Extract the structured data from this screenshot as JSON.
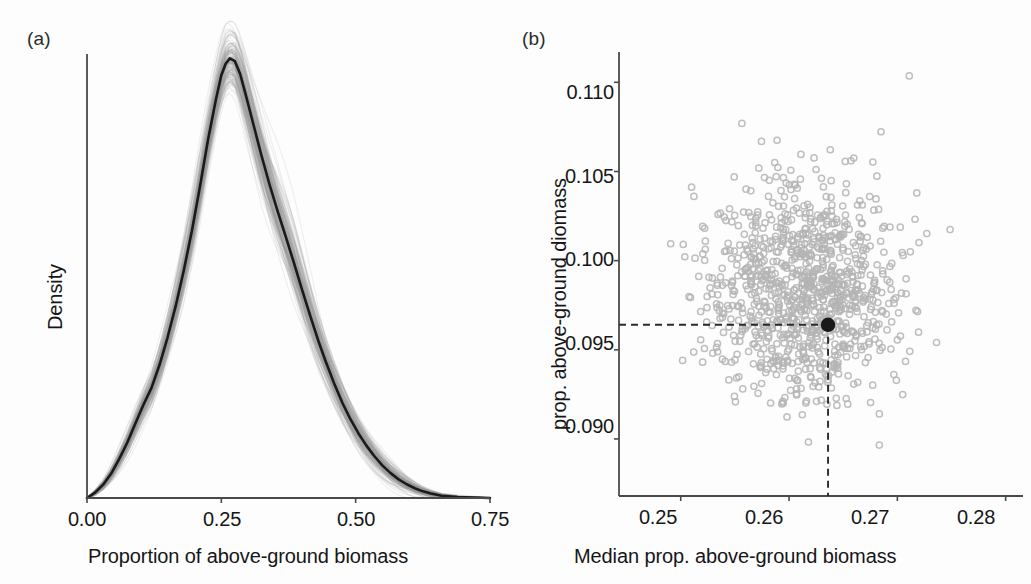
{
  "figure": {
    "background": "#fdfdfd",
    "panels": [
      "a",
      "b"
    ]
  },
  "panel_a": {
    "tag": "(a)",
    "xlabel": "Proportion of above-ground biomass",
    "ylabel": "Density",
    "xticks": [
      "0.00",
      "0.25",
      "0.50",
      "0.75"
    ]
  },
  "panel_b": {
    "tag": "(b)",
    "xlabel": "Median prop. above-ground biomass",
    "ylabel": "prop. above-ground diomass",
    "xticks": [
      "0.25",
      "0.26",
      "0.27",
      "0.28"
    ],
    "yticks": [
      "0.110",
      "0.105",
      "0.100",
      "0.095",
      "0.090"
    ]
  },
  "colors": {
    "axis": "#4a4a4a",
    "curve": "#1a1a1a",
    "bootstrap_band": "#9a9a9a",
    "scatter_point": "#b4b4b4",
    "highlight_point": "#1a1a1a",
    "dashed_guide": "#2b2b2b",
    "text": "#161616"
  },
  "chart_data": [
    {
      "type": "area",
      "panel": "a",
      "title": "",
      "xlabel": "Proportion of above-ground biomass",
      "ylabel": "Density",
      "xlim": [
        0.0,
        0.75
      ],
      "ylim": [
        0.0,
        1.0
      ],
      "xticks": [
        0.0,
        0.25,
        0.5,
        0.75
      ],
      "yticks": [],
      "grid": false,
      "legend": null,
      "description": "Kernel density estimate of the proportion of above-ground biomass. A solid black mean density curve is overlaid on a dense grey cloud of bootstrap replicate density curves.",
      "series": [
        {
          "name": "mean density curve",
          "color": "#1a1a1a",
          "x": [
            0.0,
            0.015,
            0.03,
            0.045,
            0.06,
            0.075,
            0.09,
            0.105,
            0.12,
            0.135,
            0.15,
            0.165,
            0.18,
            0.195,
            0.21,
            0.225,
            0.24,
            0.25,
            0.258,
            0.266,
            0.275,
            0.285,
            0.295,
            0.31,
            0.325,
            0.34,
            0.355,
            0.37,
            0.385,
            0.4,
            0.415,
            0.43,
            0.445,
            0.46,
            0.475,
            0.49,
            0.505,
            0.52,
            0.535,
            0.55,
            0.565,
            0.58,
            0.595,
            0.61,
            0.625,
            0.64,
            0.66,
            0.69,
            0.72,
            0.75
          ],
          "y": [
            0.0,
            0.012,
            0.03,
            0.055,
            0.088,
            0.125,
            0.168,
            0.21,
            0.248,
            0.3,
            0.362,
            0.432,
            0.512,
            0.6,
            0.7,
            0.805,
            0.898,
            0.952,
            0.978,
            0.99,
            0.984,
            0.955,
            0.91,
            0.84,
            0.77,
            0.705,
            0.645,
            0.588,
            0.53,
            0.47,
            0.412,
            0.356,
            0.305,
            0.258,
            0.215,
            0.178,
            0.146,
            0.118,
            0.094,
            0.073,
            0.056,
            0.042,
            0.031,
            0.022,
            0.015,
            0.01,
            0.005,
            0.002,
            0.001,
            0.0
          ]
        },
        {
          "name": "bootstrap envelope (upper)",
          "color": "#9a9a9a",
          "x": [
            0.0,
            0.03,
            0.06,
            0.09,
            0.12,
            0.15,
            0.18,
            0.21,
            0.24,
            0.258,
            0.266,
            0.275,
            0.295,
            0.325,
            0.355,
            0.385,
            0.415,
            0.445,
            0.475,
            0.505,
            0.535,
            0.565,
            0.595,
            0.625,
            0.66,
            0.7,
            0.75
          ],
          "y": [
            0.004,
            0.042,
            0.11,
            0.2,
            0.29,
            0.418,
            0.58,
            0.775,
            0.965,
            1.03,
            1.048,
            1.04,
            1.0,
            0.905,
            0.76,
            0.662,
            0.47,
            0.356,
            0.262,
            0.186,
            0.124,
            0.082,
            0.052,
            0.03,
            0.014,
            0.006,
            0.002
          ]
        },
        {
          "name": "bootstrap envelope (lower)",
          "color": "#9a9a9a",
          "x": [
            0.0,
            0.03,
            0.06,
            0.09,
            0.12,
            0.15,
            0.18,
            0.21,
            0.24,
            0.258,
            0.266,
            0.275,
            0.295,
            0.325,
            0.355,
            0.385,
            0.415,
            0.445,
            0.475,
            0.505,
            0.535,
            0.565,
            0.595,
            0.625,
            0.66,
            0.7,
            0.75
          ],
          "y": [
            0.0,
            0.018,
            0.062,
            0.132,
            0.205,
            0.305,
            0.442,
            0.62,
            0.818,
            0.882,
            0.905,
            0.895,
            0.84,
            0.74,
            0.6,
            0.515,
            0.345,
            0.25,
            0.168,
            0.108,
            0.06,
            0.03,
            0.014,
            0.005,
            0.001,
            0.0,
            0.0
          ]
        }
      ]
    },
    {
      "type": "scatter",
      "panel": "b",
      "title": "",
      "xlabel": "Median prop. above-ground biomass",
      "ylabel": "prop. above-ground diomass",
      "xlim": [
        0.2443,
        0.2816
      ],
      "ylim": [
        0.0868,
        0.1117
      ],
      "xticks": [
        0.25,
        0.26,
        0.27,
        0.28
      ],
      "yticks": [
        0.09,
        0.095,
        0.1,
        0.105,
        0.11
      ],
      "grid": false,
      "legend": null,
      "n_points": 1000,
      "point_color": "#b4b4b4",
      "point_style": "open-circle",
      "description": "Bootstrap replicate cloud of median vs. mean proportion of above-ground biomass. A single filled black point marks the observed estimate, with dashed guide lines dropped to both axes.",
      "cloud": {
        "x_mean": 0.2614,
        "x_sd": 0.00435,
        "y_mean": 0.0982,
        "y_sd": 0.00305,
        "correlation": 0.0
      },
      "highlight_point": {
        "name": "observed estimate",
        "x": 0.2636,
        "y": 0.0964,
        "color": "#1a1a1a",
        "guide_lines": "dashed"
      }
    }
  ]
}
